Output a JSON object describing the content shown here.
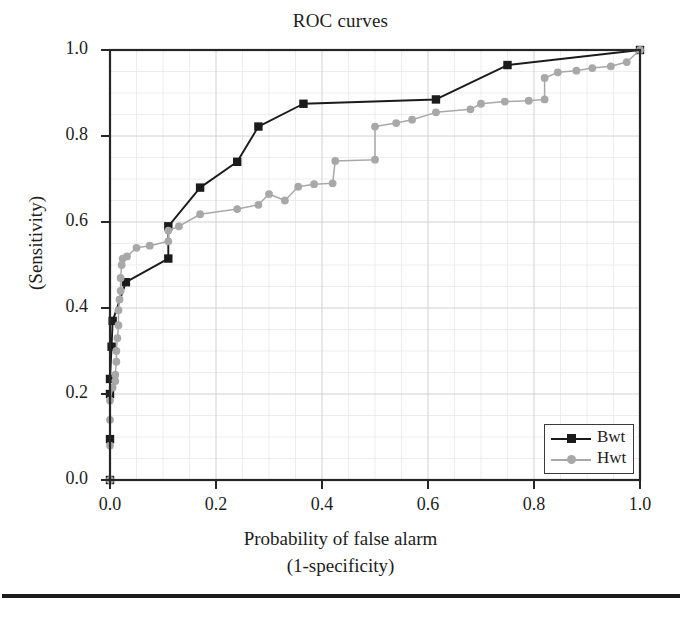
{
  "chart_data": {
    "type": "line",
    "title": "ROC curves",
    "xlabel": "Probability of false alarm",
    "xlabel_sub": "(1-specificity)",
    "ylabel": "(Sensitivity)",
    "xlim": [
      0.0,
      1.0
    ],
    "ylim": [
      0.0,
      1.0
    ],
    "xticks": [
      "0.0",
      "0.2",
      "0.4",
      "0.6",
      "0.8",
      "1.0"
    ],
    "xtick_values": [
      0.0,
      0.2,
      0.4,
      0.6,
      0.8,
      1.0
    ],
    "yticks": [
      "0.0",
      "0.2",
      "0.4",
      "0.6",
      "0.8",
      "1.0"
    ],
    "ytick_values": [
      0.0,
      0.2,
      0.4,
      0.6,
      0.8,
      1.0
    ],
    "grid": true,
    "grid_minor": true,
    "legend_position": "lower right",
    "series": [
      {
        "name": "Bwt",
        "color": "#1b1b1b",
        "marker": "square",
        "points": [
          [
            0.0,
            0.0
          ],
          [
            0.0,
            0.095
          ],
          [
            0.0,
            0.2
          ],
          [
            0.0,
            0.235
          ],
          [
            0.003,
            0.31
          ],
          [
            0.005,
            0.37
          ],
          [
            0.03,
            0.46
          ],
          [
            0.11,
            0.515
          ],
          [
            0.11,
            0.59
          ],
          [
            0.17,
            0.68
          ],
          [
            0.24,
            0.74
          ],
          [
            0.28,
            0.822
          ],
          [
            0.365,
            0.875
          ],
          [
            0.615,
            0.885
          ],
          [
            0.75,
            0.965
          ],
          [
            1.0,
            1.0
          ]
        ]
      },
      {
        "name": "Hwt",
        "color": "#a8a8a8",
        "marker": "circle",
        "points": [
          [
            0.0,
            0.0
          ],
          [
            0.0,
            0.08
          ],
          [
            0.0,
            0.14
          ],
          [
            0.0,
            0.185
          ],
          [
            0.005,
            0.215
          ],
          [
            0.01,
            0.23
          ],
          [
            0.01,
            0.245
          ],
          [
            0.012,
            0.275
          ],
          [
            0.012,
            0.3
          ],
          [
            0.014,
            0.33
          ],
          [
            0.016,
            0.36
          ],
          [
            0.016,
            0.395
          ],
          [
            0.018,
            0.42
          ],
          [
            0.02,
            0.44
          ],
          [
            0.02,
            0.47
          ],
          [
            0.022,
            0.5
          ],
          [
            0.024,
            0.515
          ],
          [
            0.032,
            0.52
          ],
          [
            0.05,
            0.54
          ],
          [
            0.075,
            0.545
          ],
          [
            0.11,
            0.555
          ],
          [
            0.11,
            0.58
          ],
          [
            0.13,
            0.59
          ],
          [
            0.17,
            0.618
          ],
          [
            0.24,
            0.63
          ],
          [
            0.28,
            0.64
          ],
          [
            0.3,
            0.665
          ],
          [
            0.33,
            0.65
          ],
          [
            0.355,
            0.682
          ],
          [
            0.385,
            0.688
          ],
          [
            0.42,
            0.69
          ],
          [
            0.425,
            0.742
          ],
          [
            0.5,
            0.745
          ],
          [
            0.5,
            0.822
          ],
          [
            0.54,
            0.83
          ],
          [
            0.57,
            0.838
          ],
          [
            0.615,
            0.855
          ],
          [
            0.68,
            0.862
          ],
          [
            0.7,
            0.875
          ],
          [
            0.745,
            0.88
          ],
          [
            0.79,
            0.882
          ],
          [
            0.82,
            0.885
          ],
          [
            0.82,
            0.935
          ],
          [
            0.845,
            0.948
          ],
          [
            0.88,
            0.952
          ],
          [
            0.91,
            0.958
          ],
          [
            0.945,
            0.962
          ],
          [
            0.975,
            0.972
          ],
          [
            1.0,
            1.0
          ]
        ]
      }
    ]
  },
  "legend": {
    "entries": [
      {
        "label": "Bwt"
      },
      {
        "label": "Hwt"
      }
    ]
  }
}
